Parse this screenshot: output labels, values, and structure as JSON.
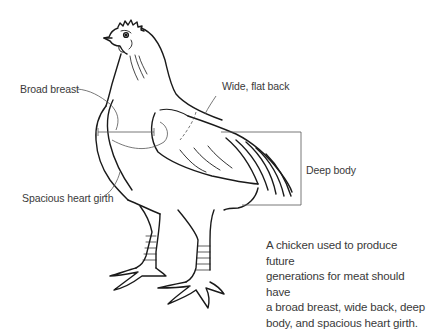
{
  "diagram": {
    "subject": "chicken",
    "labels": {
      "broad_breast": "Broad breast",
      "wide_flat_back": "Wide, flat back",
      "deep_body": "Deep body",
      "spacious_heart_girth": "Spacious heart girth"
    },
    "caption_lines": [
      "A chicken used to produce future",
      "generations for meat should have",
      "a broad breast, wide back, deep",
      "body, and spacious heart girth."
    ],
    "colors": {
      "line": "#1a1a1a",
      "leader": "#555555",
      "text": "#3a3a3a",
      "background": "#ffffff"
    }
  }
}
